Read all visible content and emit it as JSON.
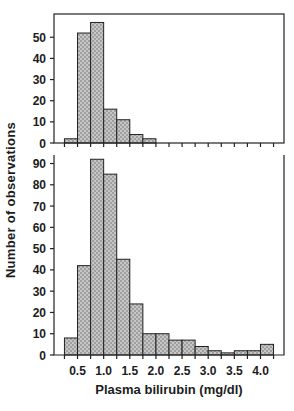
{
  "figure": {
    "ylabel": "Number of observations",
    "xlabel": "Plasma bilirubin (mg/dl)"
  },
  "colors": {
    "background": "#ffffff",
    "axis": "#222222",
    "bar_fill_base": "#c6c6c6",
    "bar_fill_dot": "#8d8d8d",
    "bar_stroke": "#222222",
    "text": "#1c1c1c"
  },
  "chart_data": [
    {
      "type": "bar",
      "subtype": "histogram",
      "panel": "top",
      "title": "",
      "xlabel": "",
      "ylabel": "Number of observations",
      "bin_start": 0.25,
      "bin_width": 0.25,
      "categories_bins": [
        "0.25-0.5",
        "0.5-0.75",
        "0.75-1.0",
        "1.0-1.25",
        "1.25-1.5",
        "1.5-1.75",
        "1.75-2.0"
      ],
      "values": [
        2,
        52,
        57,
        16,
        11,
        4,
        2
      ],
      "ylim": [
        0,
        61
      ],
      "yticks": [
        0,
        10,
        20,
        30,
        40,
        50
      ],
      "xlim": [
        0.05,
        4.45
      ],
      "xticks": [
        0.25,
        0.5,
        0.75,
        1.0,
        1.25,
        1.5,
        1.75,
        2.0,
        2.25,
        2.5,
        2.75,
        3.0,
        3.25,
        3.5,
        3.75,
        4.0,
        4.25
      ],
      "xtick_label_values": [],
      "xtick_label_texts": [],
      "grid": false,
      "frame": "box",
      "legend": null
    },
    {
      "type": "bar",
      "subtype": "histogram",
      "panel": "bottom",
      "title": "",
      "xlabel": "Plasma bilirubin (mg/dl)",
      "ylabel": "Number of observations",
      "bin_start": 0.25,
      "bin_width": 0.25,
      "categories_bins": [
        "0.25-0.5",
        "0.5-0.75",
        "0.75-1.0",
        "1.0-1.25",
        "1.25-1.5",
        "1.5-1.75",
        "1.75-2.0",
        "2.0-2.25",
        "2.25-2.5",
        "2.5-2.75",
        "2.75-3.0",
        "3.0-3.25",
        "3.25-3.5",
        "3.5-3.75",
        "3.75-4.0",
        "4.0-4.25"
      ],
      "values": [
        8,
        42,
        92,
        85,
        45,
        24,
        10,
        10,
        7,
        7,
        4,
        2,
        1,
        2,
        2,
        5
      ],
      "ylim": [
        0,
        94
      ],
      "yticks": [
        0,
        10,
        20,
        30,
        40,
        50,
        60,
        70,
        80,
        90
      ],
      "xlim": [
        0.05,
        4.45
      ],
      "xticks": [
        0.25,
        0.5,
        0.75,
        1.0,
        1.25,
        1.5,
        1.75,
        2.0,
        2.25,
        2.5,
        2.75,
        3.0,
        3.25,
        3.5,
        3.75,
        4.0,
        4.25
      ],
      "xtick_label_values": [
        0.5,
        1.0,
        1.5,
        2.0,
        2.5,
        3.0,
        3.5,
        4.0
      ],
      "xtick_label_texts": [
        "0.5",
        "1.0",
        "1.5",
        "2.0",
        "2.5",
        "3.0",
        "3.5",
        "4.0"
      ],
      "grid": false,
      "frame": "open-top",
      "legend": null
    }
  ]
}
